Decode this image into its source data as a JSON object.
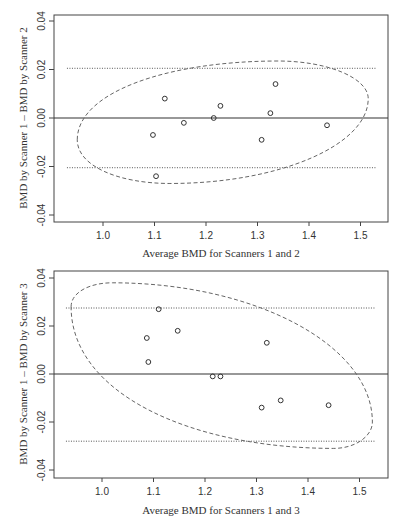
{
  "chart_data": [
    {
      "type": "scatter",
      "title": "",
      "xlabel": "Average BMD for Scanners 1 and 2",
      "ylabel": "BMD by Scanner 1 – BMD by Scanner 2",
      "xlim": [
        0.92,
        1.55
      ],
      "ylim": [
        -0.042,
        0.042
      ],
      "x_ticks": [
        "1.0",
        "1.1",
        "1.2",
        "1.3",
        "1.4",
        "1.5"
      ],
      "y_ticks": [
        "-0.04",
        "-0.02",
        "0.00",
        "0.02",
        "0.04"
      ],
      "grid": false,
      "points": [
        {
          "x": 1.097,
          "y": -0.007
        },
        {
          "x": 1.103,
          "y": -0.024
        },
        {
          "x": 1.12,
          "y": 0.008
        },
        {
          "x": 1.157,
          "y": -0.002
        },
        {
          "x": 1.215,
          "y": 0.0
        },
        {
          "x": 1.228,
          "y": 0.005
        },
        {
          "x": 1.308,
          "y": -0.009
        },
        {
          "x": 1.325,
          "y": 0.002
        },
        {
          "x": 1.335,
          "y": 0.014
        },
        {
          "x": 1.435,
          "y": -0.003
        }
      ],
      "mean_line": 0.0,
      "limits_of_agreement": {
        "upper": 0.0205,
        "lower": -0.0205,
        "x_range": [
          0.93,
          1.53
        ]
      },
      "ellipse": {
        "center_x": 1.232,
        "center_y": -0.0015,
        "left": [
          0.95,
          -0.009
        ],
        "top": [
          1.34,
          0.0235
        ],
        "right": [
          1.515,
          0.008
        ],
        "bottom": [
          1.13,
          -0.027
        ]
      }
    },
    {
      "type": "scatter",
      "title": "",
      "xlabel": "Average BMD for Scanners 1 and 3",
      "ylabel": "BMD by Scanner 1 – BMD by Scanner 3",
      "xlim": [
        0.92,
        1.55
      ],
      "ylim": [
        -0.042,
        0.042
      ],
      "x_ticks": [
        "1.0",
        "1.1",
        "1.2",
        "1.3",
        "1.4",
        "1.5"
      ],
      "y_ticks": [
        "-0.04",
        "-0.02",
        "0.00",
        "0.02",
        "0.04"
      ],
      "grid": false,
      "points": [
        {
          "x": 1.087,
          "y": 0.015
        },
        {
          "x": 1.09,
          "y": 0.005
        },
        {
          "x": 1.11,
          "y": 0.027
        },
        {
          "x": 1.147,
          "y": 0.018
        },
        {
          "x": 1.215,
          "y": -0.001
        },
        {
          "x": 1.23,
          "y": -0.001
        },
        {
          "x": 1.31,
          "y": -0.014
        },
        {
          "x": 1.32,
          "y": 0.013
        },
        {
          "x": 1.347,
          "y": -0.011
        },
        {
          "x": 1.44,
          "y": -0.013
        }
      ],
      "mean_line": 0.0,
      "limits_of_agreement": {
        "upper": 0.0275,
        "lower": -0.028,
        "x_range": [
          0.93,
          1.53
        ]
      },
      "ellipse": {
        "center_x": 1.232,
        "center_y": 0.0035,
        "left": [
          0.94,
          0.028
        ],
        "top": [
          1.02,
          0.038
        ],
        "right": [
          1.525,
          -0.02
        ],
        "bottom": [
          1.45,
          -0.031
        ]
      }
    }
  ]
}
